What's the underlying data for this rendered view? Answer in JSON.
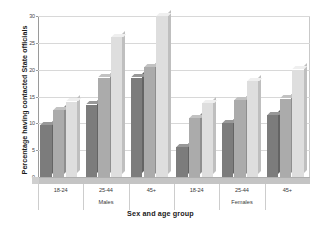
{
  "chart_data": {
    "type": "bar",
    "title": "",
    "xlabel": "Sex and age group",
    "ylabel": "Percentage having contacted State officials",
    "ylim": [
      0,
      30
    ],
    "yticks": [
      0,
      5,
      10,
      15,
      20,
      25,
      30
    ],
    "ytick_labels": [
      "0",
      "5",
      "10",
      "15",
      "20",
      "25",
      "30"
    ],
    "grid": true,
    "legend": "none",
    "categories": [
      "18-24",
      "25-44",
      "45+",
      "18-24",
      "25-44",
      "45+"
    ],
    "group_labels": [
      "Males",
      "Females"
    ],
    "series": [
      {
        "name": "series-1",
        "values": [
          9.7,
          13.5,
          18.5,
          5.5,
          10.0,
          11.5
        ],
        "color": "#7c7c7c"
      },
      {
        "name": "series-2",
        "values": [
          12.5,
          18.5,
          20.5,
          11.0,
          14.3,
          14.6
        ],
        "color": "#ababab"
      },
      {
        "name": "series-3",
        "values": [
          14.0,
          26.0,
          30.0,
          13.7,
          17.8,
          20.0
        ],
        "color": "#dedede"
      }
    ]
  },
  "axis": {
    "y_title": "Percentage having contacted State officials",
    "x_title": "Sex and age group"
  }
}
